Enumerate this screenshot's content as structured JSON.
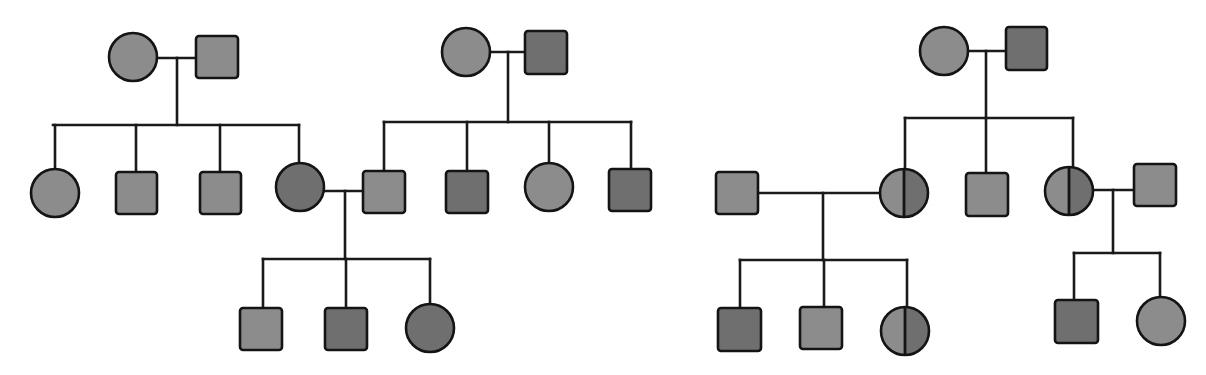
{
  "diagram": {
    "type": "pedigree",
    "colors": {
      "unaffected_fill": "#8c8c8c",
      "affected_fill": "#6f6f6f",
      "carrier_left_fill": "#8c8c8c",
      "carrier_right_fill": "#6f6f6f",
      "stroke": "#141414",
      "background": "#ffffff"
    },
    "legend_semantics": {
      "square": "male",
      "circle": "female",
      "light_fill": "unaffected",
      "dark_fill": "affected",
      "half_shaded": "carrier"
    },
    "pedigrees": [
      {
        "id": "left-pedigree",
        "individuals": [
          {
            "id": "L-I-1",
            "sex": "female",
            "status": "unaffected",
            "shape": "circle",
            "cx": 133,
            "cy": 57,
            "r": 24
          },
          {
            "id": "L-I-2",
            "sex": "male",
            "status": "unaffected",
            "shape": "square",
            "x": 196,
            "y": 36,
            "w": 42,
            "h": 42
          },
          {
            "id": "L-II-1",
            "sex": "female",
            "status": "unaffected",
            "shape": "circle",
            "cx": 55,
            "cy": 193,
            "r": 24
          },
          {
            "id": "L-II-2",
            "sex": "male",
            "status": "unaffected",
            "shape": "square",
            "x": 116,
            "y": 172,
            "w": 41,
            "h": 42
          },
          {
            "id": "L-II-3",
            "sex": "male",
            "status": "unaffected",
            "shape": "square",
            "x": 200,
            "y": 172,
            "w": 41,
            "h": 42
          },
          {
            "id": "L-II-4",
            "sex": "female",
            "status": "affected",
            "shape": "circle",
            "cx": 300,
            "cy": 187,
            "r": 24
          },
          {
            "id": "L-I-3",
            "sex": "female",
            "status": "unaffected",
            "shape": "circle",
            "cx": 466,
            "cy": 52,
            "r": 24
          },
          {
            "id": "L-I-4",
            "sex": "male",
            "status": "affected",
            "shape": "square",
            "x": 525,
            "y": 31,
            "w": 42,
            "h": 43
          },
          {
            "id": "L-II-5",
            "sex": "male",
            "status": "unaffected",
            "shape": "square",
            "x": 363,
            "y": 171,
            "w": 42,
            "h": 42
          },
          {
            "id": "L-II-6",
            "sex": "male",
            "status": "affected",
            "shape": "square",
            "x": 446,
            "y": 171,
            "w": 42,
            "h": 42
          },
          {
            "id": "L-II-7",
            "sex": "female",
            "status": "unaffected",
            "shape": "circle",
            "cx": 549,
            "cy": 187,
            "r": 24
          },
          {
            "id": "L-II-8",
            "sex": "male",
            "status": "affected",
            "shape": "square",
            "x": 609,
            "y": 169,
            "w": 42,
            "h": 42
          },
          {
            "id": "L-III-1",
            "sex": "male",
            "status": "unaffected",
            "shape": "square",
            "x": 240,
            "y": 308,
            "w": 42,
            "h": 42
          },
          {
            "id": "L-III-2",
            "sex": "male",
            "status": "affected",
            "shape": "square",
            "x": 325,
            "y": 308,
            "w": 42,
            "h": 42
          },
          {
            "id": "L-III-3",
            "sex": "female",
            "status": "affected",
            "shape": "circle",
            "cx": 430,
            "cy": 328,
            "r": 24
          }
        ],
        "lines": [
          {
            "x1": 157,
            "y1": 58,
            "x2": 196,
            "y2": 58
          },
          {
            "x1": 177,
            "y1": 58,
            "x2": 177,
            "y2": 125
          },
          {
            "x1": 53,
            "y1": 125,
            "x2": 299,
            "y2": 125
          },
          {
            "x1": 55,
            "y1": 125,
            "x2": 55,
            "y2": 169
          },
          {
            "x1": 136,
            "y1": 125,
            "x2": 136,
            "y2": 172
          },
          {
            "x1": 220,
            "y1": 125,
            "x2": 220,
            "y2": 172
          },
          {
            "x1": 299,
            "y1": 125,
            "x2": 299,
            "y2": 163
          },
          {
            "x1": 490,
            "y1": 52,
            "x2": 525,
            "y2": 52
          },
          {
            "x1": 508,
            "y1": 52,
            "x2": 508,
            "y2": 122
          },
          {
            "x1": 384,
            "y1": 122,
            "x2": 631,
            "y2": 122
          },
          {
            "x1": 384,
            "y1": 122,
            "x2": 384,
            "y2": 171
          },
          {
            "x1": 467,
            "y1": 122,
            "x2": 467,
            "y2": 171
          },
          {
            "x1": 549,
            "y1": 122,
            "x2": 549,
            "y2": 163
          },
          {
            "x1": 631,
            "y1": 122,
            "x2": 631,
            "y2": 169
          },
          {
            "x1": 324,
            "y1": 191,
            "x2": 363,
            "y2": 191
          },
          {
            "x1": 345,
            "y1": 191,
            "x2": 345,
            "y2": 259
          },
          {
            "x1": 263,
            "y1": 259,
            "x2": 430,
            "y2": 259
          },
          {
            "x1": 263,
            "y1": 259,
            "x2": 263,
            "y2": 308
          },
          {
            "x1": 346,
            "y1": 259,
            "x2": 346,
            "y2": 308
          },
          {
            "x1": 430,
            "y1": 259,
            "x2": 430,
            "y2": 304
          }
        ]
      },
      {
        "id": "right-pedigree",
        "individuals": [
          {
            "id": "R-I-1",
            "sex": "female",
            "status": "unaffected",
            "shape": "circle",
            "cx": 944,
            "cy": 51,
            "r": 24
          },
          {
            "id": "R-I-2",
            "sex": "male",
            "status": "affected",
            "shape": "square",
            "x": 1006,
            "y": 27,
            "w": 41,
            "h": 43
          },
          {
            "id": "R-II-1",
            "sex": "male",
            "status": "unaffected",
            "shape": "square",
            "x": 716,
            "y": 172,
            "w": 42,
            "h": 42
          },
          {
            "id": "R-II-2",
            "sex": "female",
            "status": "carrier",
            "shape": "circle",
            "cx": 904,
            "cy": 193,
            "r": 24
          },
          {
            "id": "R-II-3",
            "sex": "male",
            "status": "unaffected",
            "shape": "square",
            "x": 966,
            "y": 173,
            "w": 42,
            "h": 43
          },
          {
            "id": "R-II-4",
            "sex": "female",
            "status": "carrier",
            "shape": "circle",
            "cx": 1069,
            "cy": 191,
            "r": 24
          },
          {
            "id": "R-II-5",
            "sex": "male",
            "status": "unaffected",
            "shape": "square",
            "x": 1134,
            "y": 164,
            "w": 42,
            "h": 42
          },
          {
            "id": "R-III-1",
            "sex": "male",
            "status": "affected",
            "shape": "square",
            "x": 718,
            "y": 308,
            "w": 43,
            "h": 43
          },
          {
            "id": "R-III-2",
            "sex": "male",
            "status": "unaffected",
            "shape": "square",
            "x": 800,
            "y": 307,
            "w": 42,
            "h": 42
          },
          {
            "id": "R-III-3",
            "sex": "female",
            "status": "carrier",
            "shape": "circle",
            "cx": 905,
            "cy": 331,
            "r": 24
          },
          {
            "id": "R-III-4",
            "sex": "male",
            "status": "affected",
            "shape": "square",
            "x": 1055,
            "y": 300,
            "w": 43,
            "h": 43
          },
          {
            "id": "R-III-5",
            "sex": "female",
            "status": "unaffected",
            "shape": "circle",
            "cx": 1161,
            "cy": 321,
            "r": 24
          }
        ],
        "lines": [
          {
            "x1": 968,
            "y1": 51,
            "x2": 1006,
            "y2": 51
          },
          {
            "x1": 986,
            "y1": 51,
            "x2": 986,
            "y2": 118
          },
          {
            "x1": 905,
            "y1": 118,
            "x2": 1073,
            "y2": 118
          },
          {
            "x1": 905,
            "y1": 118,
            "x2": 905,
            "y2": 169
          },
          {
            "x1": 986,
            "y1": 118,
            "x2": 986,
            "y2": 173
          },
          {
            "x1": 1073,
            "y1": 118,
            "x2": 1073,
            "y2": 167
          },
          {
            "x1": 758,
            "y1": 193,
            "x2": 880,
            "y2": 193
          },
          {
            "x1": 823,
            "y1": 193,
            "x2": 823,
            "y2": 260
          },
          {
            "x1": 740,
            "y1": 260,
            "x2": 907,
            "y2": 260
          },
          {
            "x1": 740,
            "y1": 260,
            "x2": 740,
            "y2": 308
          },
          {
            "x1": 824,
            "y1": 260,
            "x2": 824,
            "y2": 307
          },
          {
            "x1": 907,
            "y1": 260,
            "x2": 907,
            "y2": 307
          },
          {
            "x1": 1093,
            "y1": 190,
            "x2": 1134,
            "y2": 190
          },
          {
            "x1": 1113,
            "y1": 190,
            "x2": 1113,
            "y2": 253
          },
          {
            "x1": 1074,
            "y1": 253,
            "x2": 1160,
            "y2": 253
          },
          {
            "x1": 1074,
            "y1": 253,
            "x2": 1074,
            "y2": 300
          },
          {
            "x1": 1160,
            "y1": 253,
            "x2": 1160,
            "y2": 297
          }
        ]
      }
    ]
  }
}
